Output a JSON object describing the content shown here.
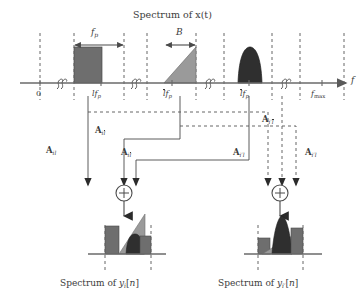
{
  "figure": {
    "title": "Spectrum of x(t)",
    "axis_variable": "f",
    "origin_label": "0"
  },
  "top_axis": {
    "ticks": [
      {
        "id": "origin",
        "label": "0",
        "x": 38
      },
      {
        "id": "lfp",
        "label_html": "lf<sub>p</sub>",
        "x": 95
      },
      {
        "id": "lbar_fp",
        "label_html": "l&#773;f<sub>p</sub>",
        "x": 168
      },
      {
        "id": "ltilde_fp",
        "label_html": "l&#771;f<sub>p</sub>",
        "x": 245
      },
      {
        "id": "fmax",
        "label_html": "f<sub>max</sub>",
        "x": 322
      }
    ],
    "dimension_arrows": [
      {
        "id": "fp-span",
        "label": "f_p",
        "x1": 72,
        "x2": 124,
        "y": 45
      },
      {
        "id": "B-span",
        "label": "B",
        "x1": 165,
        "x2": 196,
        "y": 45
      }
    ],
    "breaks_count": 4
  },
  "spectra": [
    {
      "id": "band-l",
      "shape": "rectangle",
      "color": "#6e6e6e",
      "x": 74,
      "width": 28,
      "height": 36
    },
    {
      "id": "band-lbar",
      "shape": "right-triangle",
      "color": "#9a9a9a",
      "x": 164,
      "width": 32,
      "height": 36
    },
    {
      "id": "band-ltilde",
      "shape": "dome",
      "color": "#2f2f2f",
      "x": 238,
      "width": 24,
      "height": 36
    }
  ],
  "matrices": [
    {
      "id": "A-il",
      "label_html": "<b>A</b><span class=\"sub\">il</span>",
      "x": 48,
      "y": 148
    },
    {
      "id": "A-il-bar",
      "label_html": "<b>A</b><span class=\"sub\">il&#773;</span>",
      "x": 96,
      "y": 128
    },
    {
      "id": "A-il-tilde",
      "label_html": "<b>A</b><span class=\"sub\">il&#771;</span>",
      "x": 122,
      "y": 150
    },
    {
      "id": "A-iprime-l",
      "label_html": "<b>A</b><span class=\"sub\">i&#8242;l</span>",
      "x": 236,
      "y": 150
    },
    {
      "id": "A-iprime-l-bar",
      "label_html": "<b>A</b><span class=\"sub\">i&#8242;l&#773;</span>",
      "x": 292,
      "y": 150
    },
    {
      "id": "A-iprime-l-tilde",
      "label_html": "<b>A</b><span class=\"sub\">i&#8242;l&#771;</span>",
      "x": 264,
      "y": 117
    }
  ],
  "adders": [
    {
      "id": "adder-i",
      "symbol": "+",
      "cx": 124,
      "cy": 193,
      "r": 8
    },
    {
      "id": "adder-iprime",
      "symbol": "+",
      "cx": 280,
      "cy": 193,
      "r": 8
    }
  ],
  "outputs": [
    {
      "id": "output-i",
      "caption_html": "Spectrum of y<span class=\"sub\">i</span>[n]",
      "caption_x": 64,
      "caption_y": 284,
      "axis_x": 88,
      "axis_w": 78,
      "axis_y": 254,
      "components": [
        {
          "id": "out-i-rect",
          "shape": "rectangle",
          "color": "#6e6e6e",
          "x": 105,
          "w": 14,
          "h": 28
        },
        {
          "id": "out-i-tri",
          "shape": "right-triangle",
          "color": "#9a9a9a",
          "x": 119,
          "w": 26,
          "h": 40
        },
        {
          "id": "out-i-dome",
          "shape": "dome",
          "color": "#2f2f2f",
          "x": 126,
          "w": 18,
          "h": 20
        },
        {
          "id": "out-i-rect2",
          "shape": "rectangle",
          "color": "#6e6e6e",
          "x": 140,
          "w": 11,
          "h": 18
        }
      ]
    },
    {
      "id": "output-iprime",
      "caption_html": "Spectrum of y<span class=\"sub\">i&#8242;</span>[n]",
      "caption_x": 222,
      "caption_y": 284,
      "axis_x": 244,
      "axis_w": 78,
      "axis_y": 254,
      "components": [
        {
          "id": "out-ip-rect",
          "shape": "rectangle",
          "color": "#6e6e6e",
          "x": 258,
          "w": 12,
          "h": 16
        },
        {
          "id": "out-ip-tri",
          "shape": "right-triangle",
          "color": "#9a9a9a",
          "x": 262,
          "w": 26,
          "h": 16
        },
        {
          "id": "out-ip-dome",
          "shape": "dome",
          "color": "#2f2f2f",
          "x": 272,
          "w": 20,
          "h": 44
        },
        {
          "id": "out-ip-rect2",
          "shape": "rectangle",
          "color": "#6e6e6e",
          "x": 291,
          "w": 12,
          "h": 28
        }
      ]
    }
  ],
  "colors": {
    "ink": "#3b3b3b",
    "axis": "#6a6a6a",
    "dashed": "#555555",
    "fill_mid": "#6e6e6e",
    "fill_light": "#9a9a9a",
    "fill_dark": "#2f2f2f",
    "background": "#ffffff"
  }
}
